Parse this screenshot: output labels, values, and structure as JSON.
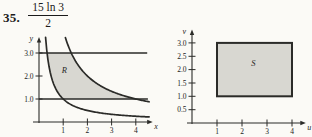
{
  "problem": {
    "number": "35.",
    "answer_numerator": "15 ln 3",
    "answer_denominator": "2"
  },
  "colors": {
    "line": "#2b2b28",
    "region_fill": "#d8d7d1",
    "paper": "#fbfaf6",
    "text": "#1c1c1c"
  },
  "chart_data": [
    {
      "id": "xy-plane",
      "type": "area",
      "title": "",
      "xlabel": "x",
      "ylabel": "y",
      "xlim": [
        0,
        4.7
      ],
      "ylim": [
        0,
        3.7
      ],
      "x_ticks": [
        1,
        2,
        3,
        4
      ],
      "x_tick_labels": [
        "1",
        "2",
        "3",
        "4"
      ],
      "y_ticks": [
        1.0,
        2.0,
        3.0
      ],
      "y_tick_labels": [
        "1.0",
        "2.0",
        "3.0"
      ],
      "grid": false,
      "hlines": [
        {
          "y": 1.0,
          "x_end": 4.5
        },
        {
          "y": 3.0,
          "x_end": 4.47
        }
      ],
      "curves": [
        {
          "name": "lower-hyperbola",
          "xy_const": 1,
          "x_start": 0.272,
          "x_end": 4.55
        },
        {
          "name": "upper-hyperbola",
          "xy_const": 4,
          "x_start": 1.09,
          "x_end": 4.55
        }
      ],
      "region": {
        "label": "R",
        "xy_min": 1,
        "xy_max": 4,
        "y_min": 1,
        "y_max": 3,
        "label_pos": [
          1.05,
          2.15
        ]
      }
    },
    {
      "id": "uv-plane",
      "type": "area",
      "title": "",
      "xlabel": "u",
      "ylabel": "v",
      "xlim": [
        0,
        4.55
      ],
      "ylim": [
        0,
        3.5
      ],
      "x_ticks": [
        1,
        2,
        3,
        4
      ],
      "x_tick_labels": [
        "1",
        "2",
        "3",
        "4"
      ],
      "y_ticks": [
        0.5,
        1.0,
        1.5,
        2.0,
        2.5,
        3.0
      ],
      "y_tick_labels": [
        "0.5",
        "1.0",
        "1.5",
        "2.0",
        "2.5",
        "3.0"
      ],
      "grid": false,
      "region": {
        "label": "S",
        "u_min": 1,
        "u_max": 4,
        "v_min": 1,
        "v_max": 3,
        "label_pos": [
          2.45,
          2.15
        ]
      }
    }
  ]
}
